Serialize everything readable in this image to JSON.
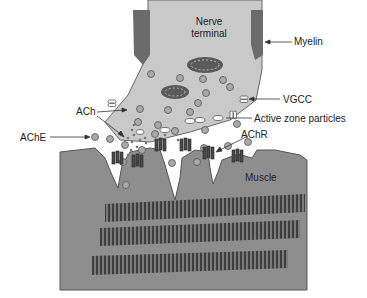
{
  "diagram": {
    "labels": {
      "nerve_terminal_line1": "Nerve",
      "nerve_terminal_line2": "terminal",
      "myelin": "Myelin",
      "vgcc": "VGCC",
      "ach": "ACh",
      "active_zone": "Active zone particles",
      "ache": "AChE",
      "achr": "AChR",
      "muscle": "Muscle"
    },
    "colors": {
      "nerve_fill": "#c9c9c9",
      "myelin_fill": "#6b6b6b",
      "muscle_fill": "#8e8e8e",
      "vesicle_fill": "#a9a9a9",
      "receptor_fill": "#4a4a4a",
      "myofibril_fill": "#5a5a5a"
    }
  }
}
